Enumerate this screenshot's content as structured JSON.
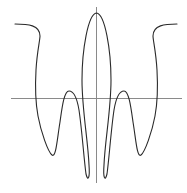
{
  "chart_data": {
    "type": "line",
    "title": "",
    "xlabel": "",
    "ylabel": "",
    "grid": false,
    "legend": null,
    "axes": {
      "color": "#8a8a8a",
      "x_axis": {
        "y": 98.5,
        "x_start": 11,
        "x_end": 182
      },
      "y_axis": {
        "x": 96.5,
        "y_start": 7,
        "y_end": 183
      }
    },
    "series": [
      {
        "name": "curve",
        "color": "#2a2a2a",
        "stroke_width": 1.1,
        "path": "M15,24 C28,24 40,25 40,36 C40,40 37,52 36,70 C35,88 35,100 38,116 C41,132 48,152 52,155 C56,158 57,140 60,122 C62,108 64,91 69,91 C74,91 77,98 79,110 C82,130 84,160 86,174 C88,182 90,178 89,165 C88,140 82,110 82,80 C82,50 88,14 96.5,13 C105,14 111,50 111,80 C111,110 105,140 104,165 C103,178 105,182 107,174 C109,160 111,130 114,110 C116,98 119,91 124,91 C129,91 131,108 133,122 C136,140 137,158 141,155 C145,152 152,132 155,116 C158,100 158,88 157,70 C156,52 153,40 153,36 C153,25 165,24 177,24"
      }
    ],
    "points_approx": [
      [
        15,
        24
      ],
      [
        40,
        36
      ],
      [
        37,
        60
      ],
      [
        35,
        90
      ],
      [
        38,
        116
      ],
      [
        52,
        155
      ],
      [
        60,
        122
      ],
      [
        69,
        91
      ],
      [
        77,
        99
      ],
      [
        84,
        150
      ],
      [
        86,
        177
      ],
      [
        89,
        165
      ],
      [
        82,
        80
      ],
      [
        96.5,
        13
      ],
      [
        111,
        80
      ],
      [
        104,
        165
      ],
      [
        107,
        177
      ],
      [
        109,
        150
      ],
      [
        116,
        99
      ],
      [
        124,
        91
      ],
      [
        133,
        122
      ],
      [
        141,
        155
      ],
      [
        155,
        116
      ],
      [
        158,
        90
      ],
      [
        156,
        60
      ],
      [
        153,
        36
      ],
      [
        177,
        24
      ]
    ]
  }
}
